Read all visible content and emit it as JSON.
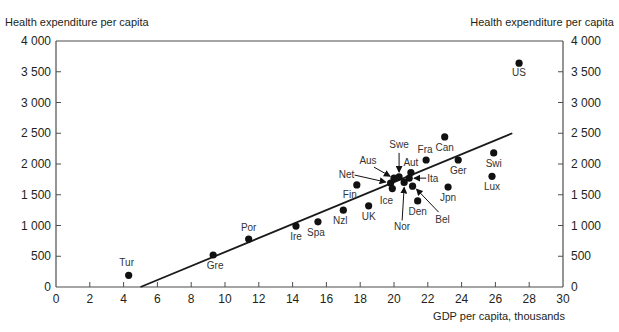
{
  "chart_data": {
    "type": "scatter",
    "title": "",
    "xlabel": "GDP per capita, thousands",
    "ylabel": "Health expenditure per capita",
    "ylabel_right": "Health expenditure per capita",
    "xlim": [
      0,
      30
    ],
    "ylim": [
      0,
      4000
    ],
    "x_ticks": [
      0,
      2,
      4,
      6,
      8,
      10,
      12,
      14,
      16,
      18,
      20,
      22,
      24,
      26,
      28,
      30
    ],
    "y_ticks": [
      0,
      500,
      1000,
      1500,
      2000,
      2500,
      3000,
      3500,
      4000
    ],
    "y_tick_labels": [
      "0",
      "500",
      "1 000",
      "1 500",
      "2 000",
      "2 500",
      "3 000",
      "3 500",
      "4 000"
    ],
    "grid": false,
    "legend": null,
    "trend_line": {
      "x": [
        5.0,
        27.0
      ],
      "y": [
        0,
        2500
      ]
    },
    "points": [
      {
        "label": "US",
        "x": 27.4,
        "y": 3640,
        "lx": 0,
        "ly": 13,
        "anchor": "middle"
      },
      {
        "label": "Tur",
        "x": 4.3,
        "y": 190,
        "lx": -2,
        "ly": -9,
        "anchor": "middle"
      },
      {
        "label": "Gre",
        "x": 9.3,
        "y": 520,
        "lx": 2,
        "ly": 14,
        "anchor": "middle"
      },
      {
        "label": "Por",
        "x": 11.4,
        "y": 780,
        "lx": 0,
        "ly": -8,
        "anchor": "middle"
      },
      {
        "label": "Ire",
        "x": 14.2,
        "y": 990,
        "lx": 0,
        "ly": 14,
        "anchor": "middle"
      },
      {
        "label": "Spa",
        "x": 15.5,
        "y": 1060,
        "lx": -2,
        "ly": 14,
        "anchor": "middle"
      },
      {
        "label": "Nzl",
        "x": 17.0,
        "y": 1250,
        "lx": -3,
        "ly": 14,
        "anchor": "middle"
      },
      {
        "label": "UK",
        "x": 18.5,
        "y": 1320,
        "lx": 0,
        "ly": 14,
        "anchor": "middle"
      },
      {
        "label": "Fin",
        "x": 17.8,
        "y": 1660,
        "lx": -7,
        "ly": 13,
        "anchor": "middle"
      },
      {
        "label": "Can",
        "x": 23.0,
        "y": 2440,
        "lx": 0,
        "ly": 14,
        "anchor": "middle"
      },
      {
        "label": "Fra",
        "x": 21.9,
        "y": 2065,
        "lx": -1,
        "ly": -7,
        "anchor": "middle"
      },
      {
        "label": "Ger",
        "x": 23.8,
        "y": 2065,
        "lx": 0,
        "ly": 14,
        "anchor": "middle"
      },
      {
        "label": "Swi",
        "x": 25.9,
        "y": 2180,
        "lx": 0,
        "ly": 14,
        "anchor": "middle"
      },
      {
        "label": "Lux",
        "x": 25.8,
        "y": 1800,
        "lx": 0,
        "ly": 14,
        "anchor": "middle"
      },
      {
        "label": "Jpn",
        "x": 23.2,
        "y": 1625,
        "lx": 0,
        "ly": 14,
        "anchor": "middle"
      },
      {
        "label": "Den",
        "x": 21.4,
        "y": 1400,
        "lx": 0,
        "ly": 14,
        "anchor": "middle"
      },
      {
        "label": "Aus",
        "x": 20.0,
        "y": 1770,
        "lx": -26,
        "ly": -14,
        "anchor": "middle",
        "arrow": [
          -20,
          -11,
          -4,
          -2
        ]
      },
      {
        "label": "Net",
        "x": 19.8,
        "y": 1690,
        "lx": -44,
        "ly": -5,
        "anchor": "middle",
        "arrow": [
          -36,
          -8,
          -5,
          -1
        ]
      },
      {
        "label": "Swe",
        "x": 20.3,
        "y": 1790,
        "lx": 0,
        "ly": -29,
        "anchor": "middle",
        "arrow": [
          0,
          -24,
          0,
          -5
        ]
      },
      {
        "label": "Ice",
        "x": 19.9,
        "y": 1600,
        "lx": -6,
        "ly": 15,
        "anchor": "middle"
      },
      {
        "label": "Aut",
        "x": 21.0,
        "y": 1860,
        "lx": 0,
        "ly": -7,
        "anchor": "middle"
      },
      {
        "label": "Ita",
        "x": 20.9,
        "y": 1770,
        "lx": 18,
        "ly": 4,
        "anchor": "start",
        "arrow": [
          17,
          0,
          5,
          0
        ]
      },
      {
        "label": "Nor",
        "x": 20.6,
        "y": 1700,
        "lx": -2,
        "ly": 48,
        "anchor": "middle",
        "arrow": [
          -2,
          38,
          0,
          5
        ]
      },
      {
        "label": "Bel",
        "x": 21.1,
        "y": 1640,
        "lx": 30,
        "ly": 37,
        "anchor": "middle",
        "arrow": [
          26,
          26,
          4,
          3
        ]
      }
    ]
  },
  "labels": {
    "ylabel_left": "Health expenditure per capita",
    "ylabel_right": "Health expenditure per capita",
    "xlabel": "GDP per capita, thousands"
  },
  "colors": {
    "ink": "#231f20",
    "axis": "#4d4d4d",
    "point": "#111111"
  }
}
